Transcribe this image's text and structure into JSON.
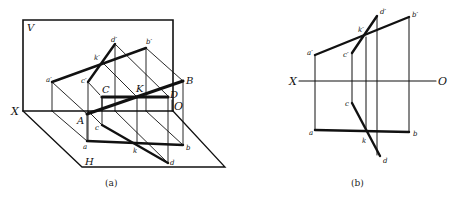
{
  "figure_a": {
    "caption": "(a)",
    "planes": {
      "v": "V",
      "h": "H"
    },
    "axis": {
      "x": "X",
      "o": "O"
    },
    "points_space": {
      "A": "A",
      "B": "B",
      "C": "C",
      "D": "D",
      "K": "K"
    },
    "points_v": {
      "a": "a′",
      "b": "b′",
      "c": "c′",
      "d": "d′",
      "k": "k′"
    },
    "points_h": {
      "a": "a",
      "b": "b",
      "c": "c",
      "d": "d",
      "k": "k"
    }
  },
  "figure_b": {
    "caption": "(b)",
    "axis": {
      "x": "X",
      "o": "O"
    },
    "points_v": {
      "a": "a′",
      "b": "b′",
      "c": "c′",
      "d": "d′",
      "k": "k′"
    },
    "points_h": {
      "a": "a",
      "b": "b",
      "c": "c",
      "d": "d",
      "k": "k"
    }
  },
  "colors": {
    "ink": "#111111",
    "paper": "#ffffff"
  }
}
